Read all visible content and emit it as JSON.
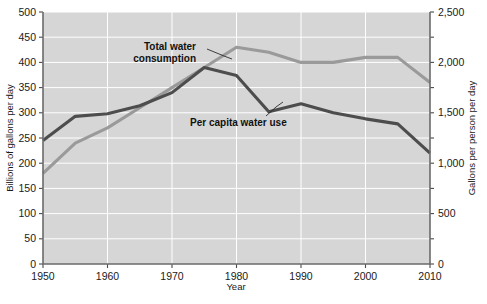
{
  "chart_data": {
    "type": "line",
    "title": "",
    "xlabel": "Year",
    "ylabel": "Billions of gallons per day",
    "ylabel_right": "Gallons per person per day",
    "x": [
      1950,
      1955,
      1960,
      1965,
      1970,
      1975,
      1980,
      1985,
      1990,
      1995,
      2000,
      2005,
      2010
    ],
    "xlim": [
      1950,
      2010
    ],
    "xticks": [
      1950,
      1960,
      1970,
      1980,
      1990,
      2000,
      2010
    ],
    "xtick_labels": [
      "1950",
      "1960",
      "1970",
      "1980",
      "1990",
      "2000",
      "2010"
    ],
    "ylim": [
      0,
      500
    ],
    "yticks": [
      0,
      50,
      100,
      150,
      200,
      250,
      300,
      350,
      400,
      450,
      500
    ],
    "ytick_labels": [
      "0",
      "50",
      "100",
      "150",
      "200",
      "250",
      "300",
      "350",
      "400",
      "450",
      "500"
    ],
    "ylim_right": [
      0,
      2500
    ],
    "yticks_right": [
      0,
      500,
      1000,
      1500,
      2000,
      2500
    ],
    "ytick_labels_right": [
      "0",
      "500",
      "1,000",
      "1,500",
      "2,000",
      "2,500"
    ],
    "grid": true,
    "legend": "inline-annotations",
    "series": [
      {
        "name": "Total water consumption",
        "axis": "left",
        "unit": "billions of gallons per day",
        "color": "#9a9a9a",
        "values": [
          180,
          240,
          270,
          310,
          350,
          390,
          430,
          420,
          400,
          400,
          410,
          410,
          360
        ]
      },
      {
        "name": "Per capita water use",
        "axis": "right",
        "unit": "gallons per person per day",
        "color": "#4d4d4d",
        "values": [
          1225,
          1465,
          1490,
          1570,
          1700,
          1950,
          1870,
          1510,
          1590,
          1500,
          1440,
          1390,
          1100
        ]
      }
    ],
    "annotations": [
      {
        "text": "Total water consumption",
        "target_series": "Total water consumption"
      },
      {
        "text": "Per capita water use",
        "target_series": "Per capita water use"
      }
    ]
  },
  "labels": {
    "total_line1": "Total water",
    "total_line2": "consumption",
    "per_capita": "Per capita water use"
  }
}
